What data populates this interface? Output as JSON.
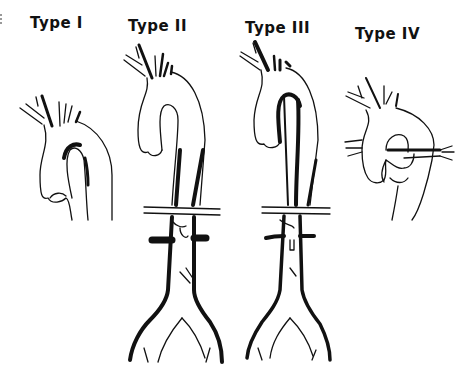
{
  "figure": {
    "panels": [
      {
        "id": "type-1",
        "label": "Type I",
        "extent": "ascending aorta and arch"
      },
      {
        "id": "type-2",
        "label": "Type II",
        "extent": "ascending aorta through abdominal aorta to iliac bifurcation"
      },
      {
        "id": "type-3",
        "label": "Type III",
        "extent": "descending thoracic aorta extending to abdominal aorta"
      },
      {
        "id": "type-4",
        "label": "Type IV",
        "extent": "ascending aorta with branch/coronary involvement"
      }
    ],
    "colors": {
      "ink": "#111111",
      "background": "#ffffff"
    }
  }
}
